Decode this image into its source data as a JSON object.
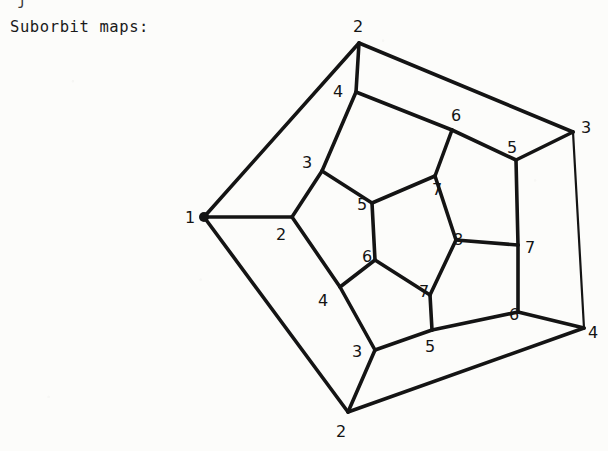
{
  "page": {
    "caption": "Suborbit maps:",
    "clipped_top_text": "j",
    "background_color": "#fcfcfa",
    "ink_color": "#141414"
  },
  "figure": {
    "name": "suborbit-map-graph",
    "type": "planar-graph-schlegel-diagram",
    "width": 608,
    "height": 451,
    "marked_vertex": "1",
    "vertices": [
      {
        "id": "v-root",
        "label": "1",
        "x": 204,
        "y": 217,
        "lx": 190,
        "ly": 218,
        "ring": "root",
        "dot": true
      },
      {
        "id": "v-o1",
        "label": "2",
        "x": 359,
        "y": 43,
        "lx": 358,
        "ly": 27,
        "ring": "outer",
        "dot": false
      },
      {
        "id": "v-o2",
        "label": "3",
        "x": 573,
        "y": 132,
        "lx": 586,
        "ly": 128,
        "ring": "outer",
        "dot": false
      },
      {
        "id": "v-o3",
        "label": "4",
        "x": 584,
        "y": 328,
        "lx": 593,
        "ly": 333,
        "ring": "outer",
        "dot": false
      },
      {
        "id": "v-o4",
        "label": "2",
        "x": 348,
        "y": 412,
        "lx": 341,
        "ly": 432,
        "ring": "outer",
        "dot": false
      },
      {
        "id": "v-m1",
        "label": "4",
        "x": 356,
        "y": 92,
        "lx": 338,
        "ly": 92,
        "ring": "middle",
        "dot": false
      },
      {
        "id": "v-m2",
        "label": "5",
        "x": 516,
        "y": 160,
        "lx": 512,
        "ly": 148,
        "ring": "middle",
        "dot": false
      },
      {
        "id": "v-m3",
        "label": "7",
        "x": 518,
        "y": 245,
        "lx": 530,
        "ly": 248,
        "ring": "middle",
        "dot": false
      },
      {
        "id": "v-m4",
        "label": "6",
        "x": 518,
        "y": 312,
        "lx": 514,
        "ly": 315,
        "ring": "middle",
        "dot": false
      },
      {
        "id": "v-m5",
        "label": "5",
        "x": 432,
        "y": 330,
        "lx": 430,
        "ly": 347,
        "ring": "middle",
        "dot": false
      },
      {
        "id": "v-m6",
        "label": "3",
        "x": 375,
        "y": 350,
        "lx": 357,
        "ly": 352,
        "ring": "middle",
        "dot": false
      },
      {
        "id": "v-m7",
        "label": "4",
        "x": 340,
        "y": 287,
        "lx": 323,
        "ly": 301,
        "ring": "middle",
        "dot": false
      },
      {
        "id": "v-m8",
        "label": "2",
        "x": 292,
        "y": 217,
        "lx": 281,
        "ly": 235,
        "ring": "middle",
        "dot": false
      },
      {
        "id": "v-m9",
        "label": "3",
        "x": 322,
        "y": 171,
        "lx": 307,
        "ly": 163,
        "ring": "middle",
        "dot": false
      },
      {
        "id": "v-i1",
        "label": "6",
        "x": 452,
        "y": 130,
        "lx": 456,
        "ly": 116,
        "ring": "inner",
        "dot": false
      },
      {
        "id": "v-i2",
        "label": "7",
        "x": 435,
        "y": 176,
        "lx": 437,
        "ly": 190,
        "ring": "inner",
        "dot": false
      },
      {
        "id": "v-i3",
        "label": "8",
        "x": 456,
        "y": 240,
        "lx": 458,
        "ly": 240,
        "ring": "inner",
        "dot": false
      },
      {
        "id": "v-i4",
        "label": "7",
        "x": 430,
        "y": 295,
        "lx": 424,
        "ly": 292,
        "ring": "inner",
        "dot": false
      },
      {
        "id": "v-i5",
        "label": "5",
        "x": 372,
        "y": 203,
        "lx": 362,
        "ly": 205,
        "ring": "inner",
        "dot": false
      },
      {
        "id": "v-i6",
        "label": "6",
        "x": 375,
        "y": 260,
        "lx": 367,
        "ly": 257,
        "ring": "inner",
        "dot": false
      }
    ],
    "edges": [
      {
        "from": "v-root",
        "to": "v-o1",
        "weight": "thick"
      },
      {
        "from": "v-root",
        "to": "v-o4",
        "weight": "thick"
      },
      {
        "from": "v-root",
        "to": "v-m8",
        "weight": "thick"
      },
      {
        "from": "v-o1",
        "to": "v-o2",
        "weight": "thick"
      },
      {
        "from": "v-o2",
        "to": "v-o3",
        "weight": "thin"
      },
      {
        "from": "v-o3",
        "to": "v-o4",
        "weight": "thick"
      },
      {
        "from": "v-o1",
        "to": "v-m1",
        "weight": "thick"
      },
      {
        "from": "v-o2",
        "to": "v-m2",
        "weight": "thick"
      },
      {
        "from": "v-o3",
        "to": "v-m4",
        "weight": "thick"
      },
      {
        "from": "v-o4",
        "to": "v-m6",
        "weight": "thick"
      },
      {
        "from": "v-m1",
        "to": "v-m9",
        "weight": "thick"
      },
      {
        "from": "v-m1",
        "to": "v-i1",
        "weight": "thick"
      },
      {
        "from": "v-m2",
        "to": "v-i1",
        "weight": "thick"
      },
      {
        "from": "v-m2",
        "to": "v-m3",
        "weight": "thick"
      },
      {
        "from": "v-m3",
        "to": "v-i3",
        "weight": "thick"
      },
      {
        "from": "v-m3",
        "to": "v-m4",
        "weight": "thick"
      },
      {
        "from": "v-m4",
        "to": "v-m5",
        "weight": "thick"
      },
      {
        "from": "v-m5",
        "to": "v-i4",
        "weight": "thick"
      },
      {
        "from": "v-m5",
        "to": "v-m6",
        "weight": "thick"
      },
      {
        "from": "v-m6",
        "to": "v-m7",
        "weight": "thick"
      },
      {
        "from": "v-m7",
        "to": "v-i6",
        "weight": "thick"
      },
      {
        "from": "v-m7",
        "to": "v-m8",
        "weight": "thick"
      },
      {
        "from": "v-m8",
        "to": "v-m9",
        "weight": "thick"
      },
      {
        "from": "v-m9",
        "to": "v-i5",
        "weight": "thick"
      },
      {
        "from": "v-i1",
        "to": "v-i2",
        "weight": "thick"
      },
      {
        "from": "v-i2",
        "to": "v-i3",
        "weight": "thick"
      },
      {
        "from": "v-i3",
        "to": "v-i4",
        "weight": "thick"
      },
      {
        "from": "v-i4",
        "to": "v-i6",
        "weight": "thick"
      },
      {
        "from": "v-i5",
        "to": "v-i2",
        "weight": "thick"
      },
      {
        "from": "v-i5",
        "to": "v-i6",
        "weight": "thick"
      }
    ]
  }
}
